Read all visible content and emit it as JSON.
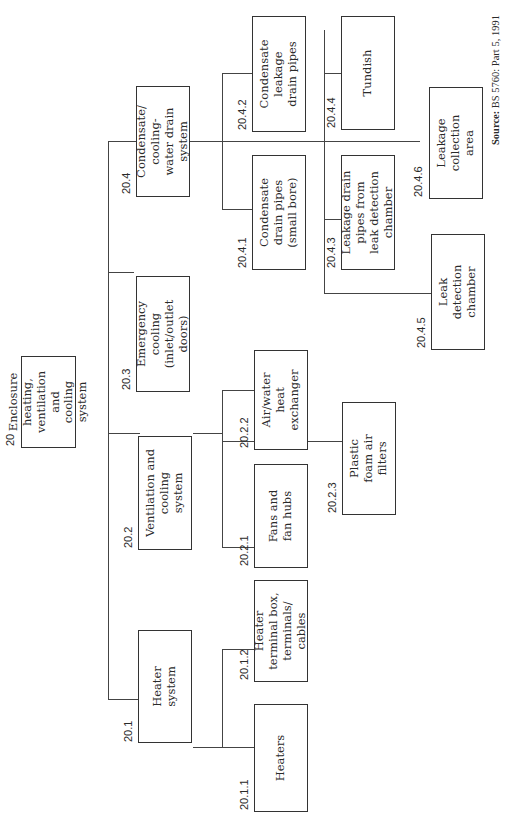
{
  "diagram": {
    "root": {
      "code": "20",
      "label": [
        "Enclosure",
        "heating,",
        "ventilation and",
        "cooling system"
      ]
    },
    "nodes": {
      "n20_1": {
        "code": "20.1",
        "label": [
          "Heater",
          "system"
        ]
      },
      "n20_1_1": {
        "code": "20.1.1",
        "label": [
          "Heaters"
        ]
      },
      "n20_1_2": {
        "code": "20.1.2",
        "label": [
          "Heater",
          "terminal box,",
          "terminals/",
          "cables"
        ]
      },
      "n20_2": {
        "code": "20.2",
        "label": [
          "Ventilation and",
          "cooling",
          "system"
        ]
      },
      "n20_2_1": {
        "code": "20.2.1",
        "label": [
          "Fans and",
          "fan hubs"
        ]
      },
      "n20_2_2": {
        "code": "20.2.2",
        "label": [
          "Air/water",
          "heat",
          "exchanger"
        ]
      },
      "n20_2_3": {
        "code": "20.2.3",
        "label": [
          "Plastic",
          "foam air",
          "filters"
        ]
      },
      "n20_3": {
        "code": "20.3",
        "label": [
          "Emergency",
          "cooling",
          "(inlet/outlet",
          "doors)"
        ]
      },
      "n20_4": {
        "code": "20.4",
        "label": [
          "Condensate/",
          "cooling-",
          "water drain",
          "system"
        ]
      },
      "n20_4_1": {
        "code": "20.4.1",
        "label": [
          "Condensate",
          "drain pipes",
          "(small bore)"
        ]
      },
      "n20_4_2": {
        "code": "20.4.2",
        "label": [
          "Condensate",
          "leakage",
          "drain pipes"
        ]
      },
      "n20_4_3": {
        "code": "20.4.3",
        "label": [
          "Leakage drain",
          "pipes from",
          "leak detection",
          "chamber"
        ]
      },
      "n20_4_4": {
        "code": "20.4.4",
        "label": [
          "Tundish"
        ]
      },
      "n20_4_5": {
        "code": "20.4.5",
        "label": [
          "Leak",
          "detection",
          "chamber"
        ]
      },
      "n20_4_6": {
        "code": "20.4.6",
        "label": [
          "Leakage",
          "collection",
          "area"
        ]
      }
    },
    "edges": [
      [
        "20",
        "20.1"
      ],
      [
        "20",
        "20.2"
      ],
      [
        "20",
        "20.3"
      ],
      [
        "20",
        "20.4"
      ],
      [
        "20.1",
        "20.1.1"
      ],
      [
        "20.1",
        "20.1.2"
      ],
      [
        "20.2",
        "20.2.1"
      ],
      [
        "20.2",
        "20.2.2"
      ],
      [
        "20.2",
        "20.2.3"
      ],
      [
        "20.4",
        "20.4.1"
      ],
      [
        "20.4",
        "20.4.2"
      ],
      [
        "20.4",
        "20.4.3"
      ],
      [
        "20.4",
        "20.4.4"
      ],
      [
        "20.4",
        "20.4.5"
      ],
      [
        "20.4",
        "20.4.6"
      ]
    ],
    "source": {
      "label": "Source:",
      "text": "BS 5760: Part 5, 1991"
    }
  }
}
